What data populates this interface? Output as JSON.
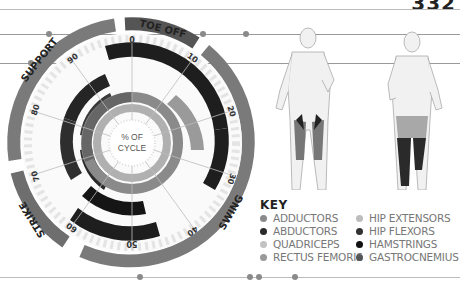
{
  "page_number": "332",
  "wheel": {
    "center_label_line1": "% OF",
    "center_label_line2": "CYCLE",
    "ticks": [
      "0",
      "10",
      "20",
      "30",
      "40",
      "50",
      "60",
      "70",
      "80",
      "90"
    ],
    "phases": [
      {
        "label": "TOE OFF",
        "color": "#555555"
      },
      {
        "label": "SWING",
        "color": "#7a7a7a"
      },
      {
        "label": "STRIKE",
        "color": "#6e6e6e"
      },
      {
        "label": "SUPPORT",
        "color": "#7a7a7a"
      }
    ]
  },
  "key": {
    "title": "KEY",
    "items": [
      {
        "label": "ADDUCTORS",
        "color": "#8a8a8a"
      },
      {
        "label": "HIP EXTENSORS",
        "color": "#bdbdbd"
      },
      {
        "label": "ABDUCTORS",
        "color": "#2a2a2a"
      },
      {
        "label": "HIP FLEXORS",
        "color": "#333333"
      },
      {
        "label": "QUADRICEPS",
        "color": "#c2c2c2"
      },
      {
        "label": "HAMSTRINGS",
        "color": "#111111"
      },
      {
        "label": "RECTUS FEMORIS",
        "color": "#9a9a9a"
      },
      {
        "label": "GASTROCNEMIUS",
        "color": "#555555"
      }
    ]
  },
  "figures": [
    {
      "view": "front"
    },
    {
      "view": "back"
    }
  ]
}
